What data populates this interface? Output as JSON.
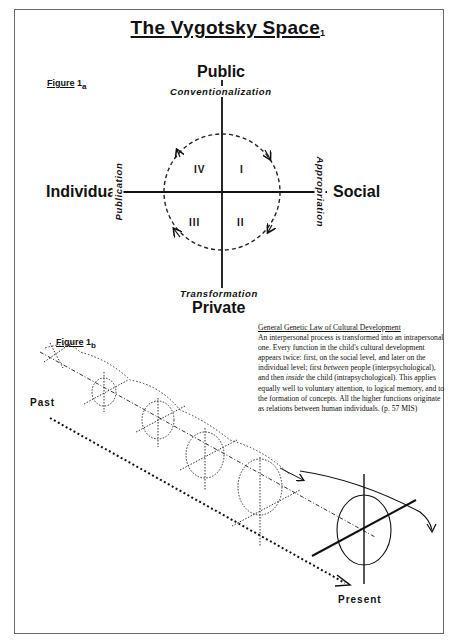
{
  "title": {
    "text": "The Vygotsky Space",
    "subscript": "1"
  },
  "figure_a": {
    "label": "Figure",
    "subscript": "a",
    "number": "1",
    "axes": {
      "top": "Public",
      "bottom": "Private",
      "left": "Individual",
      "right": "Social"
    },
    "processes": {
      "top": "Conventionalization",
      "bottom": "Transformation",
      "left": "Publication",
      "right": "Appropriation"
    },
    "quadrants": [
      "I",
      "II",
      "III",
      "IV"
    ]
  },
  "figure_b": {
    "label": "Figure",
    "number": "1",
    "subscript": "b",
    "time_start": "Past",
    "time_end": "Present"
  },
  "quote": {
    "heading": "General Genetic Law of Cultural Development",
    "body_1": "An interpersonal process is transformed into an intrapersonal one.  Every function in the child's cultural development appears twice: first, on the social level, and later on the individual level; first ",
    "em_1": "between",
    "body_2": " people (interpsychological), and then ",
    "em_2": "inside",
    "body_3": " the child (intrapsychological).  This applies equally well to voluntary attention, to logical memory, and to the formation of concepts. All the higher functions originate as relations between human individuals. (p. 57 MIS)"
  },
  "colors": {
    "ink": "#111111",
    "frame": "#6a6a6a",
    "background": "#ffffff"
  }
}
